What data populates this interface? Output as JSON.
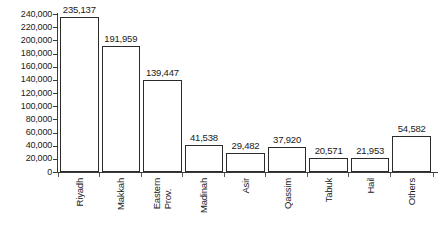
{
  "chart_data": {
    "type": "bar",
    "title": "",
    "subtitle": "",
    "xlabel": "",
    "ylabel": "",
    "categories": [
      "Riyadh",
      "Makkah",
      "Eastern Prov.",
      "Madinah",
      "Asir",
      "Qassim",
      "Tabuk",
      "Hail",
      "Others"
    ],
    "category_lines": [
      [
        "Riyadh"
      ],
      [
        "Makkah"
      ],
      [
        "Eastern",
        "Prov."
      ],
      [
        "Madinah"
      ],
      [
        "Asir"
      ],
      [
        "Qassim"
      ],
      [
        "Tabuk"
      ],
      [
        "Hail"
      ],
      [
        "Others"
      ]
    ],
    "values": [
      235137,
      191959,
      139447,
      41538,
      29482,
      37920,
      20571,
      21953,
      54582
    ],
    "value_labels": [
      "235,137",
      "191,959",
      "139,447",
      "41,538",
      "29,482",
      "37,920",
      "20,571",
      "21,953",
      "54,582"
    ],
    "ylim": [
      0,
      240000
    ],
    "ytick_step": 20000,
    "ytick_labels": [
      "240,000",
      "220,000",
      "200,000",
      "180,000",
      "160,000",
      "140,000",
      "120,000",
      "100,000",
      "80,000",
      "60,000",
      "40,000",
      "20,000",
      "0"
    ],
    "ytick_values": [
      240000,
      220000,
      200000,
      180000,
      160000,
      140000,
      120000,
      100000,
      80000,
      60000,
      40000,
      20000,
      0
    ],
    "grid": false,
    "legend": null,
    "legend_position": "none",
    "bar_style": {
      "fill": "#ffffff",
      "border": "#2b2b2b"
    },
    "axis_color": "#3a3a3a",
    "background": "#ffffff"
  }
}
